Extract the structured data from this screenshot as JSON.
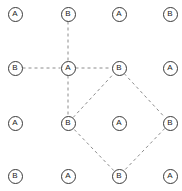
{
  "figure": {
    "width": 182,
    "height": 191,
    "background_color": "#ffffff"
  },
  "style": {
    "node_fill": "#ffffff",
    "node_stroke": "#3a3a3a",
    "node_radius": 7.5,
    "label_color": "#1c1c1c",
    "edge_color": "#8c8c8c",
    "edge_width": 1,
    "edge_dash": "3 3"
  },
  "chart_data": {
    "type": "scatter",
    "title": "",
    "xlabel": "",
    "ylabel": "",
    "grid": false,
    "legend": "none",
    "xlim": [
      0,
      182
    ],
    "ylim": [
      0,
      191
    ],
    "nodes": [
      {
        "id": "n00",
        "label": "A",
        "x": 15,
        "y": 14,
        "row": 0,
        "col": 0
      },
      {
        "id": "n01",
        "label": "B",
        "x": 68,
        "y": 14,
        "row": 0,
        "col": 1
      },
      {
        "id": "n02",
        "label": "A",
        "x": 119,
        "y": 14,
        "row": 0,
        "col": 2
      },
      {
        "id": "n03",
        "label": "B",
        "x": 170,
        "y": 14,
        "row": 0,
        "col": 3
      },
      {
        "id": "n10",
        "label": "B",
        "x": 15,
        "y": 68,
        "row": 1,
        "col": 0
      },
      {
        "id": "n11",
        "label": "A",
        "x": 68,
        "y": 68,
        "row": 1,
        "col": 1
      },
      {
        "id": "n12",
        "label": "B",
        "x": 119,
        "y": 68,
        "row": 1,
        "col": 2
      },
      {
        "id": "n13",
        "label": "A",
        "x": 170,
        "y": 68,
        "row": 1,
        "col": 3
      },
      {
        "id": "n20",
        "label": "A",
        "x": 15,
        "y": 123,
        "row": 2,
        "col": 0
      },
      {
        "id": "n21",
        "label": "B",
        "x": 68,
        "y": 123,
        "row": 2,
        "col": 1
      },
      {
        "id": "n22",
        "label": "A",
        "x": 119,
        "y": 123,
        "row": 2,
        "col": 2
      },
      {
        "id": "n23",
        "label": "B",
        "x": 170,
        "y": 123,
        "row": 2,
        "col": 3
      },
      {
        "id": "n30",
        "label": "B",
        "x": 15,
        "y": 176,
        "row": 3,
        "col": 0
      },
      {
        "id": "n31",
        "label": "A",
        "x": 68,
        "y": 176,
        "row": 3,
        "col": 1
      },
      {
        "id": "n32",
        "label": "B",
        "x": 119,
        "y": 176,
        "row": 3,
        "col": 2
      },
      {
        "id": "n33",
        "label": "A",
        "x": 170,
        "y": 176,
        "row": 3,
        "col": 3
      }
    ],
    "edges": [
      {
        "from": "n01",
        "to": "n11",
        "style": "dashed"
      },
      {
        "from": "n10",
        "to": "n11",
        "style": "dashed"
      },
      {
        "from": "n11",
        "to": "n12",
        "style": "dashed"
      },
      {
        "from": "n11",
        "to": "n21",
        "style": "dashed"
      },
      {
        "from": "n12",
        "to": "n23",
        "style": "dashed"
      },
      {
        "from": "n23",
        "to": "n32",
        "style": "dashed"
      },
      {
        "from": "n32",
        "to": "n21",
        "style": "dashed"
      },
      {
        "from": "n21",
        "to": "n12",
        "style": "dashed"
      }
    ]
  }
}
